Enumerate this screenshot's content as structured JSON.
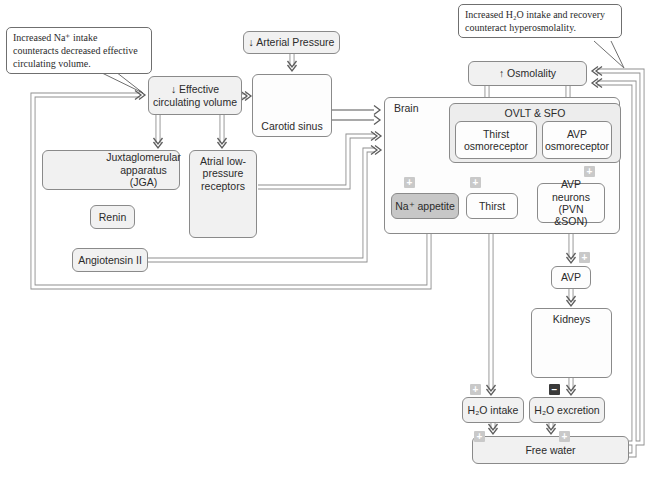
{
  "figure": {
    "background": "#ffffff",
    "callouts": {
      "na_intake": "Increased Na⁺ intake counteracts decreased effective circulating volume.",
      "h2o_intake": "Increased H₂O intake and recovery counteract hyperosmolality."
    },
    "nodes": {
      "arterial_pressure": "↓ Arterial Pressure",
      "effective_circulating_volume": "↓ Effective circulating volume",
      "carotid_sinus": "Carotid sinus",
      "osmolality": "↑ Osmolality",
      "brain": "Brain",
      "ovlt_sfo": "OVLT & SFO",
      "thirst_osmoreceptor": "Thirst osmoreceptor",
      "avp_osmoreceptor": "AVP osmoreceptor",
      "na_appetite": "Na⁺ appetite",
      "thirst": "Thirst",
      "avp_neurons": "AVP neurons (PVN &SON)",
      "avp": "AVP",
      "kidneys": "Kidneys",
      "h2o_intake": "H₂O intake",
      "h2o_excretion": "H₂O excretion",
      "free_water": "Free water",
      "jga": "Juxtaglomerular apparatus (JGA)",
      "renin": "Renin",
      "angiotensin_ii": "Angiotensin II",
      "atrial_receptors": "Atrial low-pressure receptors"
    },
    "badges": {
      "plus": "+",
      "minus": "−"
    },
    "icons": {
      "carotid": "carotid-artery-icon",
      "brain": "brain-icon",
      "heart": "heart-icon",
      "glomerulus": "glomerulus-icon",
      "kidneys": "kidneys-icon"
    },
    "colors": {
      "box_fill": "#f1f1f1",
      "box_border": "#8a8a8a",
      "na_appetite_fill": "#c7c7c7",
      "plus_badge": "#c9c9c9",
      "minus_badge": "#3a3a3a",
      "line": "#8e8e8e"
    }
  }
}
